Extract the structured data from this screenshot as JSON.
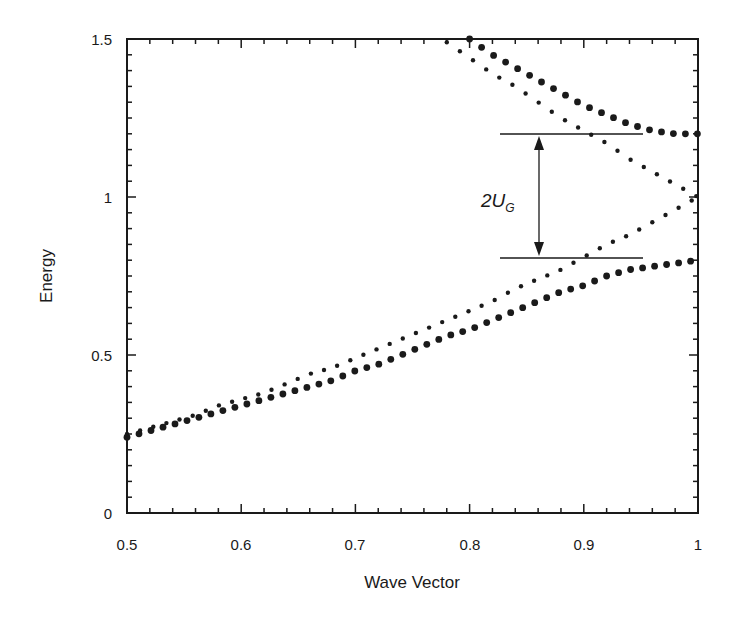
{
  "chart_data": {
    "type": "scatter",
    "title": "",
    "xlabel": "Wave Vector",
    "ylabel": "Energy",
    "xlim": [
      0.5,
      1.0
    ],
    "ylim": [
      0,
      1.5
    ],
    "grid": false,
    "legend": null,
    "x_ticks": [
      "0.5",
      "0.6",
      "0.7",
      "0.8",
      "0.9",
      "1"
    ],
    "y_ticks": [
      "0",
      "0.5",
      "1",
      "1.5"
    ],
    "series": [
      {
        "name": "free-electron parabola (E = k^2)",
        "marker": "small dot",
        "x": [
          0.5,
          0.52,
          0.54,
          0.56,
          0.58,
          0.6,
          0.62,
          0.64,
          0.66,
          0.68,
          0.7,
          0.72,
          0.74,
          0.76,
          0.78,
          0.8,
          0.82,
          0.84,
          0.86,
          0.88,
          0.9,
          0.92,
          0.94,
          0.96,
          0.98,
          1.0
        ],
        "values": [
          0.25,
          0.27,
          0.29,
          0.31,
          0.34,
          0.36,
          0.38,
          0.41,
          0.44,
          0.46,
          0.49,
          0.52,
          0.55,
          0.58,
          0.61,
          0.64,
          0.67,
          0.71,
          0.74,
          0.77,
          0.81,
          0.85,
          0.88,
          0.92,
          0.96,
          1.0
        ]
      },
      {
        "name": "reflected parabola (E = (2-k)^2)",
        "marker": "small dot",
        "x": [
          0.78,
          0.8,
          0.82,
          0.84,
          0.86,
          0.88,
          0.9,
          0.92,
          0.94,
          0.96,
          0.98,
          1.0
        ],
        "values": [
          1.49,
          1.44,
          1.39,
          1.35,
          1.3,
          1.25,
          1.21,
          1.17,
          1.12,
          1.08,
          1.04,
          1.0
        ]
      },
      {
        "name": "lower band (gap)",
        "marker": "large dot",
        "x": [
          0.5,
          0.52,
          0.54,
          0.56,
          0.58,
          0.6,
          0.62,
          0.64,
          0.66,
          0.68,
          0.7,
          0.72,
          0.74,
          0.76,
          0.78,
          0.8,
          0.82,
          0.84,
          0.86,
          0.88,
          0.9,
          0.92,
          0.94,
          0.96,
          0.98,
          1.0
        ],
        "values": [
          0.24,
          0.26,
          0.28,
          0.3,
          0.32,
          0.34,
          0.36,
          0.38,
          0.4,
          0.42,
          0.45,
          0.47,
          0.5,
          0.53,
          0.56,
          0.58,
          0.61,
          0.64,
          0.67,
          0.7,
          0.72,
          0.75,
          0.77,
          0.78,
          0.79,
          0.8
        ]
      },
      {
        "name": "upper band (gap)",
        "marker": "large dot",
        "x": [
          0.8,
          0.82,
          0.84,
          0.86,
          0.88,
          0.9,
          0.92,
          0.94,
          0.96,
          0.98,
          1.0
        ],
        "values": [
          1.5,
          1.45,
          1.41,
          1.37,
          1.33,
          1.29,
          1.26,
          1.23,
          1.21,
          1.2,
          1.2
        ]
      }
    ],
    "annotations": [
      {
        "text": "2U",
        "subscript": "G",
        "type": "double-arrow",
        "x": 0.865,
        "y_from": 0.8,
        "y_to": 1.2
      },
      {
        "type": "hline",
        "y": 1.2,
        "x_from": 0.83,
        "x_to": 0.955
      },
      {
        "type": "hline",
        "y": 0.8,
        "x_from": 0.83,
        "x_to": 0.955
      }
    ]
  },
  "labels": {
    "xlabel": "Wave Vector",
    "ylabel": "Energy",
    "gap_main": "2U",
    "gap_sub": "G",
    "x_ticks": [
      "0.5",
      "0.6",
      "0.7",
      "0.8",
      "0.9",
      "1"
    ],
    "y_ticks": [
      "0",
      "0.5",
      "1",
      "1.5"
    ]
  },
  "colors": {
    "ink": "#1a1a1a",
    "background": "#ffffff"
  }
}
